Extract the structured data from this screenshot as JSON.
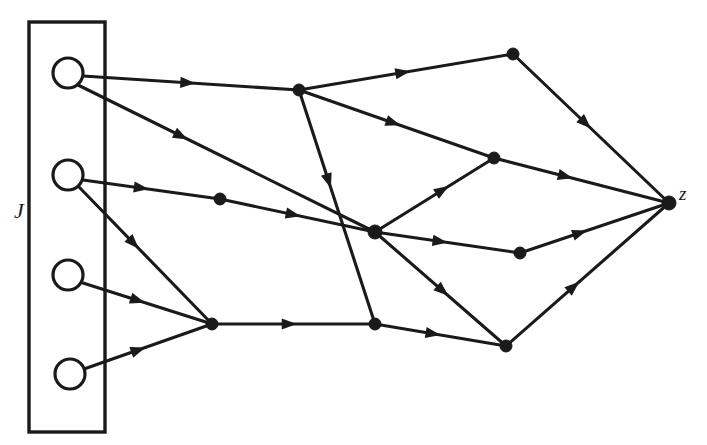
{
  "figure": {
    "background_color": "#ffffff",
    "stroke_color": "#1a1a1a",
    "width": 707,
    "height": 445
  },
  "labels": {
    "input_set": "J",
    "output_node": "z"
  },
  "chart_data": {
    "type": "diagram",
    "title": "",
    "boundary_box": {
      "x": 29,
      "y": 22,
      "width": 76,
      "height": 410
    },
    "label_positions": [
      {
        "name": "J",
        "x": 14,
        "y": 218
      },
      {
        "name": "z",
        "x": 679,
        "y": 200
      }
    ],
    "source_nodes": [
      {
        "id": "s1",
        "x": 68,
        "y": 73,
        "r": 15,
        "style": "open-circle"
      },
      {
        "id": "s2",
        "x": 68,
        "y": 175,
        "r": 15,
        "style": "open-circle"
      },
      {
        "id": "s3",
        "x": 68,
        "y": 275,
        "r": 15,
        "style": "open-circle"
      },
      {
        "id": "s4",
        "x": 70,
        "y": 374,
        "r": 15,
        "style": "open-circle"
      }
    ],
    "internal_nodes": [
      {
        "id": "n1",
        "x": 299,
        "y": 90,
        "r": 6,
        "style": "filled-dot"
      },
      {
        "id": "n2",
        "x": 220,
        "y": 199,
        "r": 6,
        "style": "filled-dot"
      },
      {
        "id": "n3",
        "x": 513,
        "y": 54,
        "r": 6,
        "style": "filled-dot"
      },
      {
        "id": "n4",
        "x": 494,
        "y": 158,
        "r": 6,
        "style": "filled-dot"
      },
      {
        "id": "n5",
        "x": 375,
        "y": 232,
        "r": 7,
        "style": "filled-dot"
      },
      {
        "id": "n6",
        "x": 212,
        "y": 324,
        "r": 6,
        "style": "filled-dot"
      },
      {
        "id": "n7",
        "x": 375,
        "y": 324,
        "r": 6,
        "style": "filled-dot"
      },
      {
        "id": "n8",
        "x": 520,
        "y": 253,
        "r": 6,
        "style": "filled-dot"
      },
      {
        "id": "n9",
        "x": 506,
        "y": 346,
        "r": 6,
        "style": "filled-dot"
      }
    ],
    "sink_node": {
      "id": "z",
      "x": 669,
      "y": 203,
      "r": 7,
      "style": "filled-dot"
    },
    "edges": [
      {
        "from": "s1",
        "to": "n1",
        "x1": 83,
        "y1": 76,
        "x2": 299,
        "y2": 90,
        "arrow_t": 0.52
      },
      {
        "from": "s1",
        "to": "n5",
        "x1": 78,
        "y1": 85,
        "x2": 375,
        "y2": 232,
        "arrow_t": 0.37
      },
      {
        "from": "s2",
        "to": "n2",
        "x1": 83,
        "y1": 180,
        "x2": 220,
        "y2": 199,
        "arrow_t": 0.48
      },
      {
        "from": "s2",
        "to": "n6",
        "x1": 79,
        "y1": 187,
        "x2": 212,
        "y2": 324,
        "arrow_t": 0.45
      },
      {
        "from": "s3",
        "to": "n6",
        "x1": 83,
        "y1": 283,
        "x2": 212,
        "y2": 324,
        "arrow_t": 0.48
      },
      {
        "from": "s4",
        "to": "n6",
        "x1": 84,
        "y1": 369,
        "x2": 212,
        "y2": 324,
        "arrow_t": 0.48
      },
      {
        "from": "n2",
        "to": "n5",
        "x1": 220,
        "y1": 199,
        "x2": 375,
        "y2": 232,
        "arrow_t": 0.52
      },
      {
        "from": "n1",
        "to": "n3",
        "x1": 299,
        "y1": 90,
        "x2": 513,
        "y2": 54,
        "arrow_t": 0.52
      },
      {
        "from": "n1",
        "to": "n4",
        "x1": 299,
        "y1": 90,
        "x2": 494,
        "y2": 158,
        "arrow_t": 0.52
      },
      {
        "from": "n1",
        "to": "n7",
        "x1": 299,
        "y1": 90,
        "x2": 375,
        "y2": 324,
        "arrow_t": 0.42
      },
      {
        "from": "n5",
        "to": "n4",
        "x1": 375,
        "y1": 232,
        "x2": 494,
        "y2": 158,
        "arrow_t": 0.62
      },
      {
        "from": "n5",
        "to": "n8",
        "x1": 375,
        "y1": 232,
        "x2": 520,
        "y2": 253,
        "arrow_t": 0.5
      },
      {
        "from": "n5",
        "to": "n9",
        "x1": 375,
        "y1": 232,
        "x2": 506,
        "y2": 346,
        "arrow_t": 0.56
      },
      {
        "from": "n6",
        "to": "n7",
        "x1": 212,
        "y1": 324,
        "x2": 375,
        "y2": 324,
        "arrow_t": 0.52
      },
      {
        "from": "n7",
        "to": "n9",
        "x1": 375,
        "y1": 324,
        "x2": 506,
        "y2": 346,
        "arrow_t": 0.5
      },
      {
        "from": "n3",
        "to": "z",
        "x1": 513,
        "y1": 54,
        "x2": 669,
        "y2": 203,
        "arrow_t": 0.5
      },
      {
        "from": "n4",
        "to": "z",
        "x1": 494,
        "y1": 158,
        "x2": 669,
        "y2": 203,
        "arrow_t": 0.45
      },
      {
        "from": "n8",
        "to": "z",
        "x1": 520,
        "y1": 253,
        "x2": 669,
        "y2": 203,
        "arrow_t": 0.45
      },
      {
        "from": "n9",
        "to": "z",
        "x1": 506,
        "y1": 346,
        "x2": 669,
        "y2": 203,
        "arrow_t": 0.45
      }
    ]
  }
}
